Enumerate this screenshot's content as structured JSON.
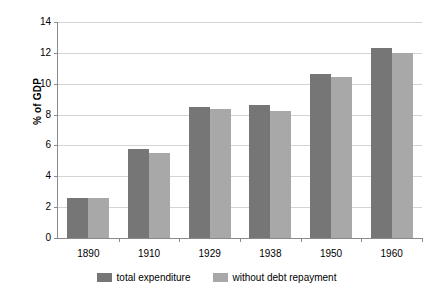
{
  "chart_data": {
    "type": "bar",
    "title": "",
    "xlabel": "",
    "ylabel": "% of GDP",
    "categories": [
      "1890",
      "1910",
      "1929",
      "1938",
      "1950",
      "1960"
    ],
    "series": [
      {
        "name": "total expenditure",
        "color": "#767676",
        "values": [
          2.6,
          5.8,
          8.5,
          8.6,
          10.6,
          12.3
        ]
      },
      {
        "name": "without debt repayment",
        "color": "#a8a8a8",
        "values": [
          2.6,
          5.5,
          8.35,
          8.25,
          10.45,
          12.0
        ]
      }
    ],
    "ylim": [
      0,
      14
    ],
    "yticks": [
      0,
      2,
      4,
      6,
      8,
      10,
      12,
      14
    ],
    "ytick_labels": [
      "0",
      "2",
      "4",
      "6",
      "8",
      "10",
      "12",
      "14"
    ],
    "grid": "horizontal",
    "legend_position": "bottom"
  }
}
